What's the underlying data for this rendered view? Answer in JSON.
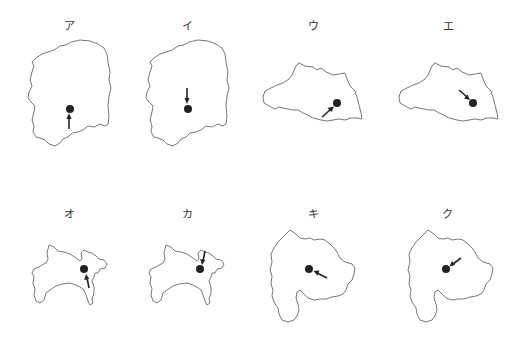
{
  "diagram": {
    "panels": [
      {
        "label": "ア",
        "shape": "tochigi",
        "dot": [
          70,
          109
        ],
        "arrow_from": [
          69,
          129
        ],
        "arrow_to": [
          69,
          115
        ],
        "label_pos": [
          69,
          26
        ]
      },
      {
        "label": "イ",
        "shape": "tochigi",
        "dot": [
          188,
          109
        ],
        "arrow_from": [
          187,
          89
        ],
        "arrow_to": [
          187,
          103
        ],
        "label_pos": [
          187,
          26
        ]
      },
      {
        "label": "ウ",
        "shape": "saitama",
        "dot": [
          337,
          103
        ],
        "arrow_from": [
          322,
          117
        ],
        "arrow_to": [
          333,
          107
        ],
        "label_pos": [
          313,
          26
        ]
      },
      {
        "label": "エ",
        "shape": "saitama",
        "dot": [
          473,
          103
        ],
        "arrow_from": [
          459,
          90
        ],
        "arrow_to": [
          469,
          99
        ],
        "label_pos": [
          448,
          26
        ]
      },
      {
        "label": "オ",
        "shape": "kanagawa",
        "dot": [
          84,
          269
        ],
        "arrow_from": [
          89,
          288
        ],
        "arrow_to": [
          86,
          275
        ],
        "label_pos": [
          69,
          214
        ]
      },
      {
        "label": "カ",
        "shape": "kanagawa",
        "dot": [
          200,
          269
        ],
        "arrow_from": [
          205,
          251
        ],
        "arrow_to": [
          202,
          263
        ],
        "label_pos": [
          187,
          214
        ]
      },
      {
        "label": "キ",
        "shape": "yamanashi",
        "dot": [
          309,
          269
        ],
        "arrow_from": [
          327,
          277
        ],
        "arrow_to": [
          314,
          272
        ],
        "label_pos": [
          313,
          214
        ]
      },
      {
        "label": "ク",
        "shape": "yamanashi",
        "dot": [
          446,
          269
        ],
        "arrow_from": [
          460,
          258
        ],
        "arrow_to": [
          450,
          266
        ],
        "label_pos": [
          447,
          214
        ]
      }
    ]
  }
}
